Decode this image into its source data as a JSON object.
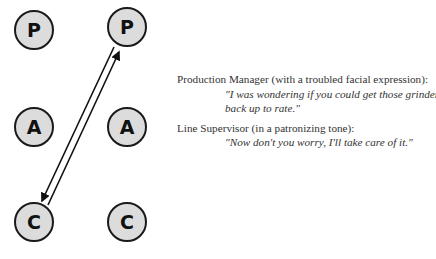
{
  "diagram": {
    "columns": [
      {
        "nodes": [
          {
            "label": "P"
          },
          {
            "label": "A"
          },
          {
            "label": "C"
          }
        ]
      },
      {
        "nodes": [
          {
            "label": "P"
          },
          {
            "label": "A"
          },
          {
            "label": "C"
          }
        ]
      }
    ],
    "transaction": {
      "from": "left column C",
      "to": "right column P",
      "type": "crossed parallel arrows"
    },
    "colors": {
      "node_fill": "#dcdcdc",
      "node_border": "#1a1a1a",
      "arrow": "#111111",
      "text": "#333333"
    }
  },
  "dialogue": [
    {
      "speaker": "Production Manager (with a troubled facial expression):",
      "quote_lines": [
        "\"I was wondering if you could get those grinders",
        "back up to rate.\""
      ]
    },
    {
      "speaker": "Line Supervisor (in a patronizing tone):",
      "quote_lines": [
        "\"Now don't you worry, I'll take care of it.\""
      ]
    }
  ]
}
